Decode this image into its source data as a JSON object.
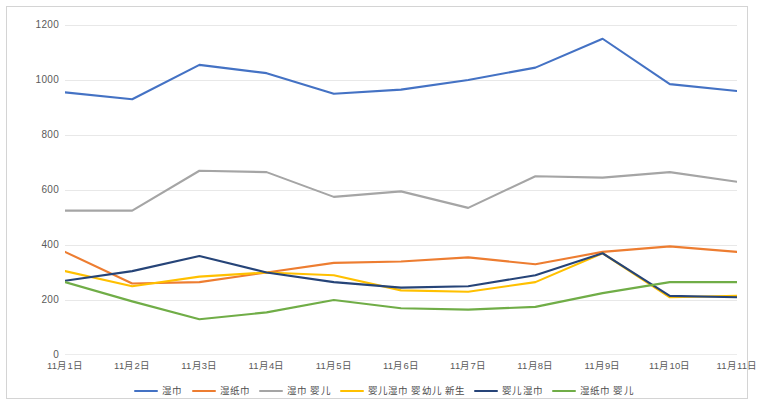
{
  "chart_data": {
    "type": "line",
    "title": "",
    "subtitle": "",
    "xlabel": "",
    "ylabel": "",
    "grid": true,
    "legend_position": "bottom",
    "ylim": [
      0,
      1200
    ],
    "yticks": [
      0,
      200,
      400,
      600,
      800,
      1000,
      1200
    ],
    "ytick_labels": [
      "0",
      "200",
      "400",
      "600",
      "800",
      "1000",
      "1200"
    ],
    "categories": [
      "11月1日",
      "11月2日",
      "11月3日",
      "11月4日",
      "11月5日",
      "11月6日",
      "11月7日",
      "11月8日",
      "11月9日",
      "11月10日",
      "11月11日"
    ],
    "series": [
      {
        "name": "湿巾",
        "color": "#4472C4",
        "values": [
          955,
          930,
          1055,
          1025,
          950,
          965,
          1000,
          1045,
          1150,
          985,
          960
        ]
      },
      {
        "name": "湿纸巾",
        "color": "#ED7D31",
        "values": [
          375,
          260,
          265,
          300,
          335,
          340,
          355,
          330,
          375,
          395,
          375
        ]
      },
      {
        "name": "湿巾 婴儿",
        "color": "#A5A5A5",
        "values": [
          525,
          525,
          670,
          665,
          575,
          595,
          535,
          650,
          645,
          665,
          630
        ]
      },
      {
        "name": "婴儿湿巾 婴幼儿 新生",
        "color": "#FFC000",
        "values": [
          305,
          250,
          285,
          300,
          290,
          235,
          230,
          265,
          370,
          210,
          215
        ]
      },
      {
        "name": "婴儿湿巾",
        "color": "#264478",
        "values": [
          270,
          305,
          360,
          300,
          265,
          245,
          250,
          290,
          370,
          215,
          210
        ]
      },
      {
        "name": "湿纸巾 婴儿",
        "color": "#70AD47",
        "values": [
          265,
          195,
          130,
          155,
          200,
          170,
          165,
          175,
          225,
          265,
          265
        ]
      }
    ]
  }
}
